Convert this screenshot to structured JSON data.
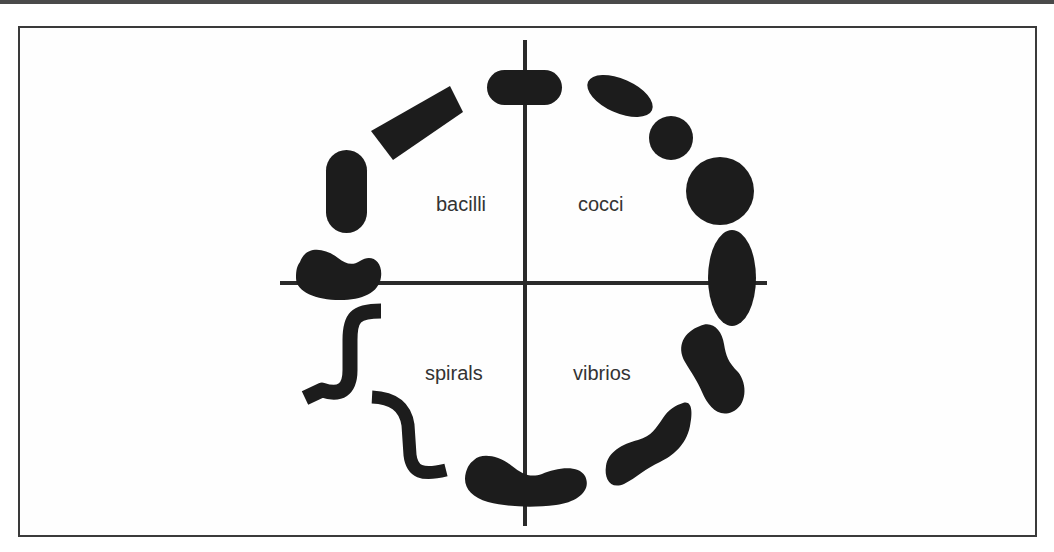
{
  "diagram": {
    "type": "bacterial-morphology-wheel",
    "colors": {
      "shape_fill": "#1c1c1c",
      "axis": "#2a2a2a",
      "frame": "#3a3a3a",
      "label_text": "#333333",
      "background": "#ffffff"
    },
    "quadrants": [
      {
        "id": "bacilli",
        "label": "bacilli",
        "position": "upper-left"
      },
      {
        "id": "cocci",
        "label": "cocci",
        "position": "upper-right"
      },
      {
        "id": "spirals",
        "label": "spirals",
        "position": "lower-left"
      },
      {
        "id": "vibrios",
        "label": "vibrios",
        "position": "lower-right"
      }
    ],
    "axes": {
      "horizontal": {
        "x1": 280,
        "x2": 767,
        "y": 283
      },
      "vertical": {
        "x": 525,
        "y1": 40,
        "y2": 526
      }
    }
  }
}
